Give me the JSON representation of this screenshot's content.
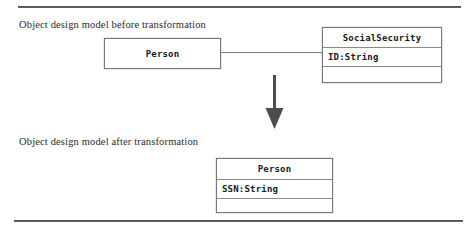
{
  "figure": {
    "captions": {
      "before": "Object design model before transformation",
      "after": "Object design model after transformation"
    }
  },
  "diagram_before": {
    "classes": [
      {
        "name": "Person",
        "attributes": [],
        "empty_compartment": ""
      },
      {
        "name": "SocialSecurity",
        "attributes": [
          "ID:String"
        ],
        "empty_compartment": ""
      }
    ],
    "association": {
      "from": "Person",
      "to": "SocialSecurity",
      "type": "plain-association"
    }
  },
  "diagram_after": {
    "classes": [
      {
        "name": "Person",
        "attributes": [
          "SSN:String"
        ],
        "empty_compartment": ""
      }
    ]
  },
  "transformation": {
    "arrow": "down-arrow",
    "color": "#4d4d4d"
  },
  "rules": {
    "top": "horizontal-rule",
    "bottom": "horizontal-rule"
  }
}
